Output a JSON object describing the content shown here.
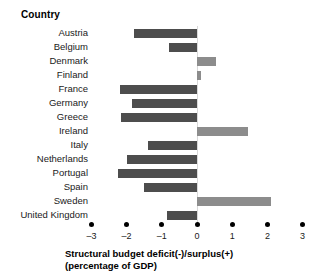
{
  "header": {
    "column_header": "Country"
  },
  "axis": {
    "title_line1": "Structural budget deficit(-)/surplus(+)",
    "title_line2": "(percentage of GDP)",
    "ticks": [
      "–3",
      "–2",
      "–1",
      "0",
      "1",
      "2",
      "3"
    ]
  },
  "colors": {
    "negative_bar": "#4d4d4d",
    "positive_bar": "#8c8c8c",
    "zero_line": "#d9d9d9",
    "text": "#1a1a1a",
    "background": "#ffffff"
  },
  "chart_data": {
    "type": "bar",
    "orientation": "horizontal",
    "title": "",
    "xlabel": "Structural budget deficit(-)/surplus(+) (percentage of GDP)",
    "ylabel": "Country",
    "xlim": [
      -3,
      3
    ],
    "xticks": [
      -3,
      -2,
      -1,
      0,
      1,
      2,
      3
    ],
    "grid": false,
    "legend": "none",
    "categories": [
      "Austria",
      "Belgium",
      "Denmark",
      "Finland",
      "France",
      "Germany",
      "Greece",
      "Ireland",
      "Italy",
      "Netherlands",
      "Portugal",
      "Spain",
      "Sweden",
      "United Kingdom"
    ],
    "values": [
      -1.8,
      -0.8,
      0.55,
      0.1,
      -2.2,
      -1.85,
      -2.15,
      1.45,
      -1.4,
      -2.0,
      -2.25,
      -1.5,
      2.1,
      -0.85
    ]
  }
}
